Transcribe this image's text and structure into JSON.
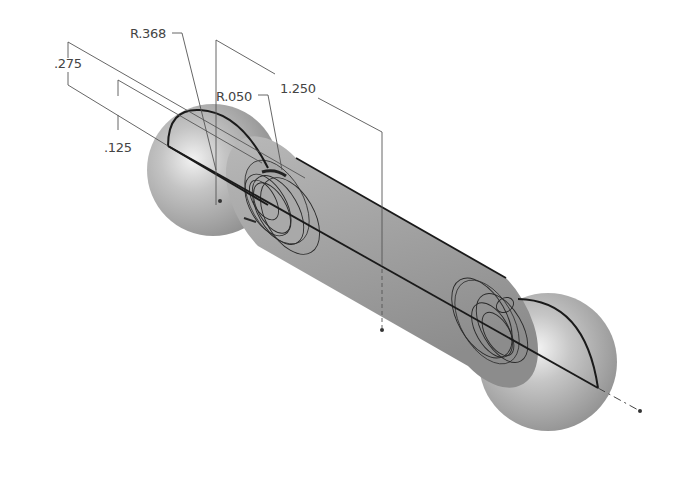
{
  "drawing": {
    "type": "isometric sketch of dumbbell-shaped revolved part",
    "colors": {
      "background": "#ffffff",
      "body_shade": "#9a9a9a",
      "highlight": "#e8e8e8",
      "sketch_line": "#1a1a1a",
      "dimension_line": "#555555"
    },
    "dimensions": [
      {
        "id": "r368",
        "label": "R.368"
      },
      {
        "id": "d275",
        "label": ".275"
      },
      {
        "id": "d125",
        "label": ".125"
      },
      {
        "id": "r050",
        "label": "R.050"
      },
      {
        "id": "d1250",
        "label": "1.250"
      }
    ]
  }
}
